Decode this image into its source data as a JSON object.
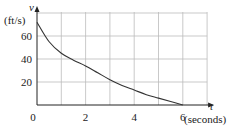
{
  "chart_data": {
    "type": "line",
    "title": "",
    "xlabel": "t",
    "xlabel_unit": "(seconds)",
    "ylabel": "v",
    "ylabel_unit": "(ft/s)",
    "x_ticks": [
      "0",
      "2",
      "4",
      "6"
    ],
    "y_ticks": [
      "20",
      "40",
      "60"
    ],
    "xlim": [
      0,
      7
    ],
    "ylim": [
      0,
      80
    ],
    "grid": true,
    "x": [
      0,
      0.5,
      1,
      1.5,
      2,
      2.5,
      3,
      3.5,
      4,
      4.5,
      5,
      5.5,
      6
    ],
    "series": [
      {
        "name": "v(t)",
        "values": [
          72,
          55,
          45,
          39,
          34,
          28,
          22,
          17,
          13,
          9,
          6,
          3,
          0
        ]
      }
    ],
    "colors": {
      "grid": "#bbbbbb",
      "axis": "#222222",
      "curve": "#333333"
    }
  }
}
